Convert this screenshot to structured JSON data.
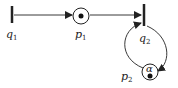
{
  "diagram": {
    "type": "petri-net",
    "transitions": [
      {
        "id": "q1",
        "label": "q",
        "sub": "1"
      },
      {
        "id": "q2",
        "label": "q",
        "sub": "2"
      }
    ],
    "places": [
      {
        "id": "p1",
        "label": "p",
        "sub": "1",
        "tokens": 1
      },
      {
        "id": "p2",
        "label": "p",
        "sub": "2",
        "tokens": 1,
        "annotation": "α"
      }
    ],
    "arcs": [
      {
        "from": "q1",
        "to": "p1"
      },
      {
        "from": "p1",
        "to": "q2"
      },
      {
        "from": "q2",
        "to": "p2"
      },
      {
        "from": "p2",
        "to": "q2"
      }
    ],
    "colors": {
      "stroke": "#222222"
    }
  }
}
